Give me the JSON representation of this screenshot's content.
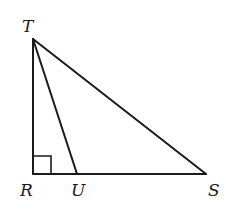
{
  "diagram": {
    "type": "geometry",
    "stroke_color": "#1a1a1a",
    "vertices": {
      "T": {
        "label": "T",
        "x": 33,
        "y": 39
      },
      "R": {
        "label": "R",
        "x": 33,
        "y": 174
      },
      "U": {
        "label": "U",
        "x": 77,
        "y": 174
      },
      "S": {
        "label": "S",
        "x": 206,
        "y": 174
      }
    },
    "segments": [
      {
        "name": "TR",
        "from": "T",
        "to": "R"
      },
      {
        "name": "RS",
        "from": "R",
        "to": "S"
      },
      {
        "name": "TS",
        "from": "T",
        "to": "S"
      },
      {
        "name": "TU",
        "from": "T",
        "to": "U"
      }
    ],
    "right_angle_marker": {
      "at": "R",
      "size": 18
    },
    "labels": {
      "T": "T",
      "R": "R",
      "U": "U",
      "S": "S"
    }
  }
}
